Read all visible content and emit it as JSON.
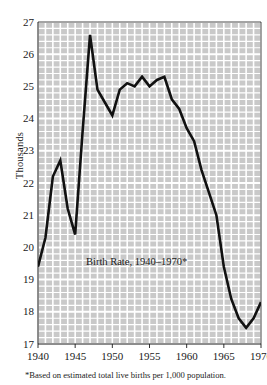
{
  "chart_data": {
    "type": "line",
    "caption": "Birth Rate, 1940–1970*",
    "footnote": "*Based on estimated total live births per 1,000 population.",
    "xlabel": "",
    "ylabel": "Thousands",
    "xlim": [
      1940,
      1970
    ],
    "ylim": [
      17,
      27
    ],
    "grid": true,
    "legend": "none",
    "line_color": "#111111",
    "plot_background": "#c9c9c9",
    "gridline_color": "#ffffff",
    "ytick_labels": [
      "27",
      "26",
      "25",
      "24",
      "23",
      "22",
      "21",
      "20",
      "19",
      "18",
      "17"
    ],
    "ytick_values": [
      27,
      26,
      25,
      24,
      23,
      22,
      21,
      20,
      19,
      18,
      17
    ],
    "xtick_labels": [
      "1940",
      "1945",
      "1950",
      "1955",
      "1960",
      "1965",
      "1970"
    ],
    "xtick_values": [
      1940,
      1945,
      1950,
      1955,
      1960,
      1965,
      1970
    ],
    "x": [
      1940,
      1941,
      1942,
      1943,
      1944,
      1945,
      1946,
      1947,
      1948,
      1949,
      1950,
      1951,
      1952,
      1953,
      1954,
      1955,
      1956,
      1957,
      1958,
      1959,
      1960,
      1961,
      1962,
      1963,
      1964,
      1965,
      1966,
      1967,
      1968,
      1969,
      1970
    ],
    "values": [
      19.4,
      20.3,
      22.2,
      22.7,
      21.2,
      20.4,
      23.6,
      26.6,
      24.9,
      24.5,
      24.1,
      24.9,
      25.1,
      25.0,
      25.3,
      25.0,
      25.2,
      25.3,
      24.6,
      24.3,
      23.7,
      23.3,
      22.4,
      21.7,
      21.0,
      19.4,
      18.4,
      17.8,
      17.5,
      17.8,
      18.3
    ],
    "series_name": "Birth Rate"
  },
  "ylabel_text": "Thousands"
}
